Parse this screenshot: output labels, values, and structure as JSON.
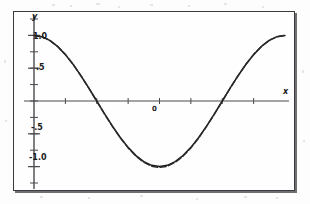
{
  "figure": {
    "background_color": "#fdfdfd",
    "frame_color": "#3a3a3f",
    "curve_color": "#1c1c1c",
    "axis_color": "#4a4a4f"
  },
  "axes": {
    "y_axis_name": "y",
    "x_axis_name": "x",
    "x_origin_label": "0"
  },
  "chart_data": {
    "type": "line",
    "title": "",
    "subtitle": "",
    "xlabel": "x",
    "ylabel": "y",
    "grid": false,
    "legend_position": "none",
    "xlim": [
      0,
      6.2832
    ],
    "ylim": [
      -1.25,
      1.25
    ],
    "x_tick_labels": [
      "0"
    ],
    "x_tick_values": [
      3.1416
    ],
    "x_minor_tick_values": [
      0.7854,
      1.5708,
      2.3562,
      3.1416,
      3.927,
      4.7124,
      5.4978
    ],
    "y_tick_labels": [
      "1.0",
      ".5",
      "-.5",
      "-1.0"
    ],
    "y_tick_values": [
      1.0,
      0.5,
      -0.5,
      -1.0
    ],
    "y_minor_tick_values": [
      1.25,
      1.0,
      0.75,
      0.5,
      0.25,
      0,
      -0.25,
      -0.5,
      -0.75,
      -1.0,
      -1.25
    ],
    "annotations": [],
    "series": [
      {
        "name": "cos(x)",
        "style": "solid",
        "color": "#1c1c1c",
        "x": [
          0,
          0.1963,
          0.3927,
          0.589,
          0.7854,
          0.9817,
          1.1781,
          1.3744,
          1.5708,
          1.7671,
          1.9635,
          2.1598,
          2.3562,
          2.5525,
          2.7489,
          2.9452,
          3.1416,
          3.3379,
          3.5343,
          3.7306,
          3.927,
          4.1233,
          4.3197,
          4.516,
          4.7124,
          4.9087,
          5.1051,
          5.3014,
          5.4978,
          5.6941,
          5.8905,
          6.0868,
          6.2832
        ],
        "y": [
          1.0,
          0.9808,
          0.9239,
          0.8315,
          0.7071,
          0.5556,
          0.3827,
          0.1951,
          0.0,
          -0.1951,
          -0.3827,
          -0.5556,
          -0.7071,
          -0.8315,
          -0.9239,
          -0.9808,
          -1.0,
          -0.9808,
          -0.9239,
          -0.8315,
          -0.7071,
          -0.5556,
          -0.3827,
          -0.1951,
          0.0,
          0.1951,
          0.3827,
          0.5556,
          0.7071,
          0.8315,
          0.9239,
          0.9808,
          1.0
        ]
      },
      {
        "name": "approximation",
        "style": "dashed",
        "color": "#2a2a2a",
        "x": [
          0,
          0.1963,
          0.3927,
          0.589,
          0.7854,
          0.9817,
          1.1781,
          1.3744,
          1.5708,
          1.7671,
          1.9635,
          2.1598,
          2.3562,
          2.5525,
          2.7489,
          2.9452,
          3.1416,
          3.3379,
          3.5343,
          3.7306,
          3.927,
          4.1233,
          4.3197,
          4.516,
          4.7124,
          4.9087,
          5.1051,
          5.3014,
          5.4978,
          5.6941,
          5.8905,
          6.0868,
          6.2832
        ],
        "y": [
          1.0,
          0.981,
          0.926,
          0.834,
          0.709,
          0.556,
          0.381,
          0.193,
          -0.004,
          -0.199,
          -0.388,
          -0.562,
          -0.715,
          -0.84,
          -0.934,
          -0.994,
          -1.013,
          -0.994,
          -0.934,
          -0.84,
          -0.715,
          -0.562,
          -0.388,
          -0.199,
          -0.004,
          0.193,
          0.381,
          0.556,
          0.709,
          0.834,
          0.926,
          0.981,
          1.0
        ]
      }
    ]
  }
}
